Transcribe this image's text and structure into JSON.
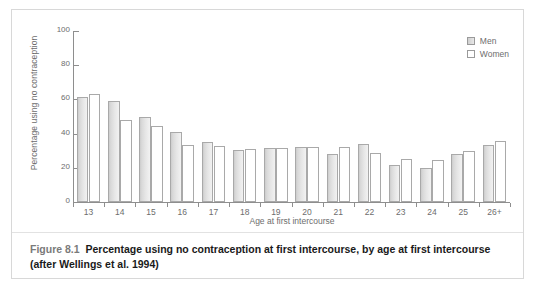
{
  "figure": {
    "number_label": "Figure 8.1",
    "caption_text": "Percentage using no contraception at first intercourse, by age at first intercourse (after Wellings et al. 1994)"
  },
  "legend": {
    "position": "top-right",
    "entries": [
      {
        "label": "Men",
        "swatch": "men-swatch",
        "color": "#d9d9d9"
      },
      {
        "label": "Women",
        "swatch": "women-swatch",
        "color": "#ffffff"
      }
    ]
  },
  "chart_data": {
    "type": "bar",
    "title": "",
    "subtitle": "",
    "xlabel": "Age at first intercourse",
    "ylabel": "Percentage using no contraception",
    "categories": [
      "13",
      "14",
      "15",
      "16",
      "17",
      "18",
      "19",
      "20",
      "21",
      "22",
      "23",
      "24",
      "25",
      "26+"
    ],
    "series": [
      {
        "name": "Men",
        "values": [
          61.5,
          59,
          50,
          41,
          35,
          30.5,
          31.5,
          32,
          28,
          34,
          21.5,
          20,
          28,
          33.5
        ]
      },
      {
        "name": "Women",
        "values": [
          63,
          48,
          44.5,
          33.5,
          33,
          31,
          31.5,
          32,
          32,
          28.5,
          25,
          24.5,
          30,
          35.5
        ]
      }
    ],
    "ylim": [
      0,
      100
    ],
    "yticks": [
      0,
      20,
      40,
      60,
      80,
      100
    ],
    "grid": false,
    "legend_position": "top-right"
  }
}
